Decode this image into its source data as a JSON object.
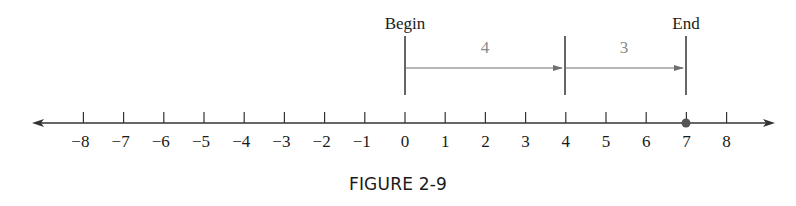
{
  "caption": "FIGURE 2-9",
  "labels": {
    "begin": "Begin",
    "end": "End",
    "segment1": "4",
    "segment2": "3"
  },
  "colors": {
    "axis": "#333333",
    "arrow": "#707070",
    "segment_label": "#8a8a8a",
    "point": "#555555"
  },
  "chart_data": {
    "type": "number_line",
    "title": "FIGURE 2-9",
    "range": [
      -8,
      8
    ],
    "ticks": [
      -8,
      -7,
      -6,
      -5,
      -4,
      -3,
      -2,
      -1,
      0,
      1,
      2,
      3,
      4,
      5,
      6,
      7,
      8
    ],
    "tick_labels": [
      "−8",
      "−7",
      "−6",
      "−5",
      "−4",
      "−3",
      "−2",
      "−1",
      "0",
      "1",
      "2",
      "3",
      "4",
      "5",
      "6",
      "7",
      "8"
    ],
    "markers": [
      {
        "at": 0,
        "label": "Begin"
      },
      {
        "at": 4,
        "label": ""
      },
      {
        "at": 7,
        "label": "End"
      }
    ],
    "arrows": [
      {
        "from": 0,
        "to": 4,
        "label": "4"
      },
      {
        "from": 4,
        "to": 7,
        "label": "3"
      }
    ],
    "points": [
      {
        "at": 7
      }
    ]
  }
}
